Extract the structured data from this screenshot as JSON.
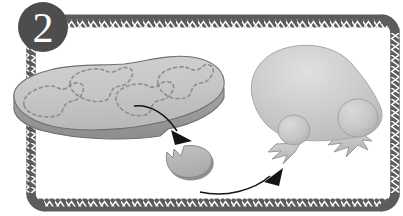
{
  "illustration": {
    "title": "Instructional step illustration",
    "step_badge": {
      "label": "2",
      "shape": "circle",
      "fill_color": "#4d4d4d",
      "text_color": "#ffffff"
    },
    "frame": {
      "style": "rounded rectangle with zigzag chevron band border",
      "band_color": "#595959",
      "zigzag_color": "#ffffff",
      "background_color": "#ffffff"
    },
    "objects": [
      {
        "name": "slab-platform",
        "description": "flat gray slab seen in perspective with dashed outlines of pieces on its surface",
        "top_color": "#c6c6c6",
        "side_color": "#9a9a9a",
        "outline_color": "#6e6e6e",
        "dashed_marking_color": "#8c8c8c",
        "dashed_shape_count": 4
      },
      {
        "name": "detached-piece",
        "description": "small broken piece with jagged left edge lying below the slab",
        "fill_color": "#b4b4b4",
        "shadow_color": "#8e8e8e"
      },
      {
        "name": "creature-body",
        "description": "large rounded blob body of a creature",
        "fill_color": "#c9c9c9",
        "highlight_color": "#dcdcdc"
      },
      {
        "name": "creature-foot-front",
        "description": "round ankle bump with jagged claw foot",
        "fill_color": "#c4c4c4"
      },
      {
        "name": "creature-foot-back",
        "description": "round ankle bump with jagged claw foot",
        "fill_color": "#c4c4c4"
      }
    ],
    "arrows": [
      {
        "name": "arrow-piece-detaching",
        "description": "curved arrow from the slab surface pointing down-right to the detached piece",
        "color": "#1a1a1a",
        "direction": "down-right"
      },
      {
        "name": "arrow-piece-to-creature",
        "description": "curved arrow from the detached piece pointing up-right to the creature foot",
        "color": "#1a1a1a",
        "direction": "up-right"
      }
    ]
  }
}
